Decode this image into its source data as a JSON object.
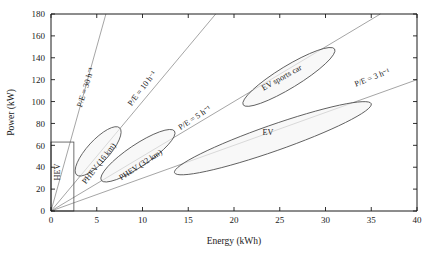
{
  "chart_data": {
    "type": "scatter",
    "title": "",
    "xlabel": "Energy (kWh)",
    "ylabel": "Power (kW)",
    "xlim": [
      0,
      40
    ],
    "ylim": [
      0,
      180
    ],
    "xticks": [
      "0",
      "5",
      "10",
      "15",
      "20",
      "25",
      "30",
      "35",
      "40"
    ],
    "yticks": [
      "0",
      "20",
      "40",
      "60",
      "80",
      "100",
      "120",
      "140",
      "160",
      "180"
    ],
    "grid": false,
    "legend": "none",
    "ratio_lines": [
      {
        "id": "pe30",
        "label": "P/E = 30 h⁻¹",
        "slope": 30,
        "x_end": 6,
        "y_end": 180,
        "label_x": 88,
        "label_y": 88,
        "rotate": -72.5
      },
      {
        "id": "pe10",
        "label": "P/E = 10 h⁻¹",
        "slope": 10,
        "x_end": 18,
        "y_end": 180,
        "label_x": 144,
        "label_y": 90,
        "rotate": -52.5
      },
      {
        "id": "pe5",
        "label": "P/E = 5 h⁻¹",
        "slope": 5,
        "x_end": 36,
        "y_end": 180,
        "label_x": 196,
        "label_y": 120,
        "rotate": -33.5
      },
      {
        "id": "pe3",
        "label": "P/E = 3 h⁻¹",
        "slope": 3,
        "x_end": 40,
        "y_end": 120,
        "label_x": 373,
        "label_y": 80,
        "rotate": -21.5
      }
    ],
    "regions": [
      {
        "id": "hev",
        "shape": "rect",
        "label": "HEV",
        "x_range": [
          0,
          2.5
        ],
        "y_range": [
          0,
          63
        ],
        "label_x": 60,
        "label_y": 172,
        "rotate": -90
      },
      {
        "id": "phev16",
        "shape": "ellipse",
        "label": "PHEV (16 km)",
        "x_range": [
          2.8,
          7.5
        ],
        "y_range": [
          33,
          76
        ],
        "label_x": 101,
        "label_y": 165,
        "rotate": -52
      },
      {
        "id": "phev32",
        "shape": "ellipse",
        "label": "PHEV (32 km)",
        "x_range": [
          5.5,
          13.5
        ],
        "y_range": [
          28,
          73
        ],
        "label_x": 142,
        "label_y": 167,
        "rotate": -33
      },
      {
        "id": "ev-sports",
        "shape": "ellipse",
        "label": "EV sports car",
        "x_range": [
          21,
          31
        ],
        "y_range": [
          97,
          148
        ],
        "label_x": 283,
        "label_y": 80,
        "rotate": -29
      },
      {
        "id": "ev",
        "shape": "ellipse",
        "label": "EV",
        "x_range": [
          13.5,
          35
        ],
        "y_range": [
          35,
          98
        ],
        "label_x": 268,
        "label_y": 135,
        "rotate": 0
      }
    ],
    "colors": {
      "axis": "#1a1a1a",
      "ratio_line": "#8e8e8e",
      "region_outline": "#4d4d4d",
      "region_fill": "#f4f4f4",
      "background": "#ffffff",
      "text": "#1a1a1a"
    }
  }
}
